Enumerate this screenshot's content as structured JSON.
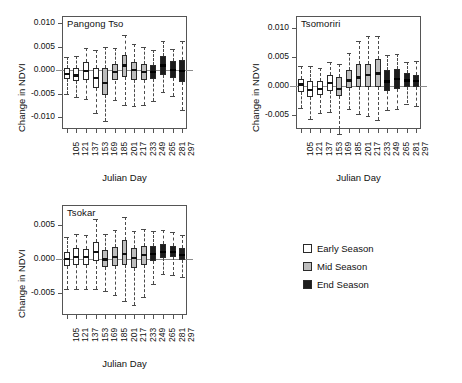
{
  "figure": {
    "xlabel": "Julian Day",
    "ylabel": "Change in NDVI"
  },
  "legend": {
    "position": "bottom-right",
    "items": [
      {
        "label": "Early Season",
        "color": "#ffffff"
      },
      {
        "label": "Mid Season",
        "color": "#bdbdbd"
      },
      {
        "label": "End Season",
        "color": "#1c1c1c"
      }
    ]
  },
  "chart_data": [
    {
      "type": "box",
      "title": "Pangong Tso",
      "xlabel": "Julian Day",
      "ylabel": "Change in NDVI",
      "ylim": [
        -0.0125,
        0.0115
      ],
      "yticks": [
        -0.01,
        -0.005,
        0.0,
        0.005,
        0.01
      ],
      "ytick_labels": [
        "-0.010",
        "-0.005",
        "0.000",
        "0.005",
        "0.010"
      ],
      "categories": [
        105,
        121,
        137,
        153,
        169,
        185,
        201,
        217,
        233,
        249,
        265,
        281,
        297
      ],
      "season": [
        "Early",
        "Early",
        "Early",
        "Early",
        "Mid",
        "Mid",
        "Mid",
        "Mid",
        "Mid",
        "End",
        "End",
        "End",
        "End"
      ],
      "boxes": [
        {
          "x": 105,
          "whisker_low": -0.005,
          "q1": -0.0018,
          "median": -0.0008,
          "q3": 0.0005,
          "whisker_high": 0.0027
        },
        {
          "x": 121,
          "whisker_low": -0.0057,
          "q1": -0.0023,
          "median": -0.0011,
          "q3": 0.0005,
          "whisker_high": 0.0029
        },
        {
          "x": 137,
          "whisker_low": -0.0062,
          "q1": -0.002,
          "median": -0.0002,
          "q3": 0.0017,
          "whisker_high": 0.0046
        },
        {
          "x": 153,
          "whisker_low": -0.009,
          "q1": -0.0038,
          "median": -0.0017,
          "q3": 0.0004,
          "whisker_high": 0.0043
        },
        {
          "x": 169,
          "whisker_low": -0.0108,
          "q1": -0.0052,
          "median": -0.0027,
          "q3": 0.0005,
          "whisker_high": 0.005
        },
        {
          "x": 185,
          "whisker_low": -0.0063,
          "q1": -0.0022,
          "median": -0.0004,
          "q3": 0.0013,
          "whisker_high": 0.0046
        },
        {
          "x": 201,
          "whisker_low": -0.0073,
          "q1": -0.0014,
          "median": 0.001,
          "q3": 0.0033,
          "whisker_high": 0.0075
        },
        {
          "x": 217,
          "whisker_low": -0.0077,
          "q1": -0.002,
          "median": 0.0,
          "q3": 0.0017,
          "whisker_high": 0.0055
        },
        {
          "x": 233,
          "whisker_low": -0.0075,
          "q1": -0.0021,
          "median": -0.0004,
          "q3": 0.0014,
          "whisker_high": 0.005
        },
        {
          "x": 249,
          "whisker_low": -0.0065,
          "q1": -0.0019,
          "median": -0.0004,
          "q3": 0.001,
          "whisker_high": 0.0043
        },
        {
          "x": 265,
          "whisker_low": -0.0046,
          "q1": -0.0011,
          "median": 0.001,
          "q3": 0.0029,
          "whisker_high": 0.0062
        },
        {
          "x": 281,
          "whisker_low": -0.0055,
          "q1": -0.0017,
          "median": 0.0,
          "q3": 0.002,
          "whisker_high": 0.0045
        },
        {
          "x": 297,
          "whisker_low": -0.0085,
          "q1": -0.0025,
          "median": -0.0001,
          "q3": 0.0022,
          "whisker_high": 0.0062
        }
      ]
    },
    {
      "type": "box",
      "title": "Tsomoriri",
      "xlabel": "Julian Day",
      "ylabel": "Change in NDVI",
      "ylim": [
        -0.0075,
        0.012
      ],
      "yticks": [
        -0.005,
        0.0,
        0.005,
        0.01
      ],
      "ytick_labels": [
        "-0.005",
        "0.000",
        "0.005",
        "0.010"
      ],
      "categories": [
        105,
        121,
        137,
        153,
        169,
        185,
        201,
        217,
        233,
        249,
        265,
        281,
        297
      ],
      "season": [
        "Early",
        "Early",
        "Early",
        "Early",
        "Mid",
        "Mid",
        "Mid",
        "Mid",
        "Mid",
        "End",
        "End",
        "End",
        "End"
      ],
      "boxes": [
        {
          "x": 105,
          "whisker_low": -0.0039,
          "q1": -0.0011,
          "median": 0.0002,
          "q3": 0.0012,
          "whisker_high": 0.0033
        },
        {
          "x": 121,
          "whisker_low": -0.0057,
          "q1": -0.0019,
          "median": -0.0007,
          "q3": 0.0008,
          "whisker_high": 0.0034
        },
        {
          "x": 137,
          "whisker_low": -0.0048,
          "q1": -0.0017,
          "median": -0.0006,
          "q3": 0.0007,
          "whisker_high": 0.0031
        },
        {
          "x": 153,
          "whisker_low": -0.0046,
          "q1": -0.0009,
          "median": 0.0004,
          "q3": 0.0018,
          "whisker_high": 0.0041
        },
        {
          "x": 169,
          "whisker_low": -0.0084,
          "q1": -0.0018,
          "median": -0.0006,
          "q3": 0.0014,
          "whisker_high": 0.0038
        },
        {
          "x": 185,
          "whisker_low": -0.004,
          "q1": -0.0004,
          "median": 0.0009,
          "q3": 0.0026,
          "whisker_high": 0.0057
        },
        {
          "x": 201,
          "whisker_low": -0.0049,
          "q1": -0.0003,
          "median": 0.0014,
          "q3": 0.0038,
          "whisker_high": 0.0077
        },
        {
          "x": 217,
          "whisker_low": -0.0053,
          "q1": -0.0002,
          "median": 0.0018,
          "q3": 0.0038,
          "whisker_high": 0.0086
        },
        {
          "x": 233,
          "whisker_low": -0.0059,
          "q1": -0.0003,
          "median": 0.0021,
          "q3": 0.0045,
          "whisker_high": 0.0086
        },
        {
          "x": 249,
          "whisker_low": -0.0043,
          "q1": -0.0009,
          "median": 0.0007,
          "q3": 0.0026,
          "whisker_high": 0.0053
        },
        {
          "x": 265,
          "whisker_low": -0.0041,
          "q1": -0.0006,
          "median": 0.0011,
          "q3": 0.0028,
          "whisker_high": 0.0054
        },
        {
          "x": 281,
          "whisker_low": -0.0031,
          "q1": -0.0002,
          "median": 0.0009,
          "q3": 0.0021,
          "whisker_high": 0.0041
        },
        {
          "x": 297,
          "whisker_low": -0.0036,
          "q1": -0.0003,
          "median": 0.0008,
          "q3": 0.0019,
          "whisker_high": 0.0042
        }
      ]
    },
    {
      "type": "box",
      "title": "Tsokar",
      "xlabel": "Julian Day",
      "ylabel": "Change in NDVI",
      "ylim": [
        -0.0082,
        0.008
      ],
      "yticks": [
        -0.005,
        0.0,
        0.005
      ],
      "ytick_labels": [
        "-0.005",
        "0.000",
        "0.005"
      ],
      "categories": [
        105,
        121,
        137,
        153,
        169,
        185,
        201,
        217,
        233,
        249,
        265,
        281,
        297
      ],
      "season": [
        "Early",
        "Early",
        "Early",
        "Early",
        "Mid",
        "Mid",
        "Mid",
        "Mid",
        "Mid",
        "End",
        "End",
        "End",
        "End"
      ],
      "boxes": [
        {
          "x": 105,
          "whisker_low": -0.0043,
          "q1": -0.001,
          "median": 0.0001,
          "q3": 0.0011,
          "whisker_high": 0.0033
        },
        {
          "x": 121,
          "whisker_low": -0.0044,
          "q1": -0.0008,
          "median": 0.0004,
          "q3": 0.0016,
          "whisker_high": 0.0038
        },
        {
          "x": 137,
          "whisker_low": -0.0044,
          "q1": -0.0008,
          "median": 0.0003,
          "q3": 0.0015,
          "whisker_high": 0.0036
        },
        {
          "x": 153,
          "whisker_low": -0.0043,
          "q1": -0.0003,
          "median": 0.0011,
          "q3": 0.0026,
          "whisker_high": 0.006
        },
        {
          "x": 169,
          "whisker_low": -0.0046,
          "q1": -0.0012,
          "median": 0.0,
          "q3": 0.0013,
          "whisker_high": 0.0037
        },
        {
          "x": 185,
          "whisker_low": -0.0052,
          "q1": -0.001,
          "median": 0.0004,
          "q3": 0.0018,
          "whisker_high": 0.0043
        },
        {
          "x": 201,
          "whisker_low": -0.0062,
          "q1": -0.0009,
          "median": 0.0008,
          "q3": 0.0028,
          "whisker_high": 0.0063
        },
        {
          "x": 217,
          "whisker_low": -0.0068,
          "q1": -0.0013,
          "median": 0.0002,
          "q3": 0.0017,
          "whisker_high": 0.0042
        },
        {
          "x": 233,
          "whisker_low": -0.0055,
          "q1": -0.0008,
          "median": 0.0007,
          "q3": 0.002,
          "whisker_high": 0.0045
        },
        {
          "x": 249,
          "whisker_low": -0.0036,
          "q1": -0.0002,
          "median": 0.0008,
          "q3": 0.0019,
          "whisker_high": 0.0041
        },
        {
          "x": 265,
          "whisker_low": -0.0022,
          "q1": 0.0002,
          "median": 0.0011,
          "q3": 0.0022,
          "whisker_high": 0.0043
        },
        {
          "x": 281,
          "whisker_low": -0.0023,
          "q1": 0.0003,
          "median": 0.0011,
          "q3": 0.002,
          "whisker_high": 0.004
        },
        {
          "x": 297,
          "whisker_low": -0.0026,
          "q1": -0.0001,
          "median": 0.0007,
          "q3": 0.0016,
          "whisker_high": 0.0036
        }
      ]
    }
  ]
}
